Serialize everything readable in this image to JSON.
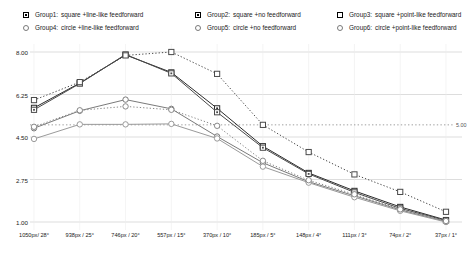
{
  "legend": {
    "entries": [
      {
        "name": "Group1:",
        "desc": "square +line-like feedforward",
        "marker": "square-dot",
        "row": 1,
        "col": 1
      },
      {
        "name": "Group2:",
        "desc": "square +no feedforward",
        "marker": "square-dot",
        "row": 1,
        "col": 2
      },
      {
        "name": "Group3:",
        "desc": "square +point-like feedforward",
        "marker": "square-open",
        "row": 1,
        "col": 3
      },
      {
        "name": "Group4:",
        "desc": "circle +line-like feedforward",
        "marker": "circle-open",
        "row": 2,
        "col": 1
      },
      {
        "name": "Group5:",
        "desc": "circle +no feedforward",
        "marker": "circle-open",
        "row": 2,
        "col": 2
      },
      {
        "name": "Group6:",
        "desc": "circle +point-like feedforward",
        "marker": "circle-open",
        "row": 2,
        "col": 3
      }
    ]
  },
  "chart_data": {
    "type": "line",
    "title": "",
    "xlabel": "",
    "ylabel": "",
    "ylim": [
      1.0,
      8.0
    ],
    "yticks": [
      8.0,
      6.25,
      4.5,
      2.75,
      1.0
    ],
    "ytick_labels": [
      "8.00",
      "6.25",
      "4.50",
      "2.75",
      "1.00"
    ],
    "grid": true,
    "legend_position": "top",
    "categories": [
      "1050px/ 28°",
      "938px / 25°",
      "746px / 20°",
      "557px / 15°",
      "370px / 10°",
      "185px / 5°",
      "148px / 4°",
      "111px / 3°",
      "74px / 2°",
      "37px / 1°"
    ],
    "reference_lines": [
      {
        "value": 5.0,
        "label": "5.00",
        "style": "dotted"
      }
    ],
    "series": [
      {
        "name": "Group1",
        "label": "square +line-like feedforward",
        "marker": "square-dot",
        "line": "solid",
        "color": "#2b2b2b",
        "values": [
          5.7,
          6.72,
          7.88,
          7.16,
          5.68,
          4.12,
          3.02,
          2.28,
          1.62,
          1.08
        ]
      },
      {
        "name": "Group2",
        "label": "square +no feedforward",
        "marker": "square-dot",
        "line": "solid",
        "color": "#4a4a4a",
        "values": [
          5.62,
          6.7,
          7.9,
          7.12,
          5.52,
          4.06,
          2.98,
          2.22,
          1.56,
          1.06
        ]
      },
      {
        "name": "Group3",
        "label": "square +point-like feedforward",
        "marker": "square-open",
        "line": "dotted",
        "color": "#4a4a4a",
        "values": [
          6.02,
          6.76,
          7.86,
          8.0,
          7.1,
          5.0,
          3.88,
          2.96,
          2.24,
          1.42
        ]
      },
      {
        "name": "Group4",
        "label": "circle +line-like feedforward",
        "marker": "circle-open",
        "line": "solid",
        "color": "#7a7a7a",
        "values": [
          4.86,
          5.58,
          6.04,
          5.66,
          4.52,
          3.44,
          2.66,
          2.08,
          1.5,
          1.02
        ]
      },
      {
        "name": "Group5",
        "label": "circle +no feedforward",
        "marker": "circle-open",
        "line": "solid",
        "color": "#9a9a9a",
        "values": [
          4.42,
          5.02,
          5.02,
          5.04,
          4.44,
          3.28,
          2.62,
          2.02,
          1.46,
          1.0
        ]
      },
      {
        "name": "Group6",
        "label": "circle +point-like feedforward",
        "marker": "circle-open",
        "line": "dotted",
        "color": "#8a8a8a",
        "values": [
          4.92,
          5.6,
          5.76,
          5.62,
          4.96,
          3.52,
          2.72,
          2.14,
          1.52,
          1.04
        ]
      }
    ]
  }
}
